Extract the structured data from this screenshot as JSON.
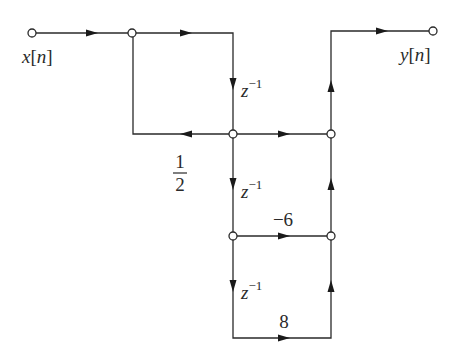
{
  "diagram": {
    "type": "signal-flow-graph",
    "input_label": "x[n]",
    "output_label": "y[n]",
    "input_var": "x",
    "output_var": "y",
    "index_var": "n",
    "delay_label_base": "z",
    "delay_label_exp": "−1",
    "gains": {
      "feedback_half_num": "1",
      "feedback_half_den": "2",
      "coef_mid": "−6",
      "coef_bottom": "8"
    },
    "nodes": [
      {
        "id": "input",
        "x": 32,
        "y": 33
      },
      {
        "id": "sum1",
        "x": 132,
        "y": 33
      },
      {
        "id": "w0",
        "x": 233,
        "y": 134
      },
      {
        "id": "out_sum1",
        "x": 331,
        "y": 134
      },
      {
        "id": "w1",
        "x": 233,
        "y": 236
      },
      {
        "id": "out_sum2",
        "x": 331,
        "y": 236
      },
      {
        "id": "output",
        "x": 433,
        "y": 31
      }
    ],
    "edges": [
      {
        "from": "input",
        "to": "sum1",
        "gain": ""
      },
      {
        "from": "sum1",
        "to": "w0",
        "gain": "z^-1 path start"
      },
      {
        "from": "w0",
        "to": "sum1",
        "gain": "1/2"
      },
      {
        "from": "w0",
        "to": "out_sum1",
        "gain": ""
      },
      {
        "from": "w0",
        "to": "w1",
        "gain": "z^-1"
      },
      {
        "from": "w1",
        "to": "out_sum2",
        "gain": "-6"
      },
      {
        "from": "w1",
        "to": "bottom",
        "gain": "z^-1"
      },
      {
        "from": "bottom",
        "to": "out_sum2",
        "gain": "8"
      },
      {
        "from": "out_sum2",
        "to": "out_sum1",
        "gain": ""
      },
      {
        "from": "out_sum1",
        "to": "output",
        "gain": ""
      }
    ],
    "colors": {
      "ink": "#2a2a2a",
      "background": "#ffffff"
    }
  }
}
